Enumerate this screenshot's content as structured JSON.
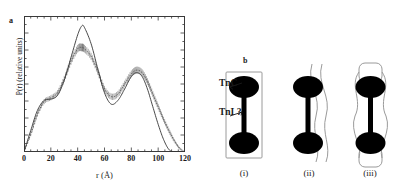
{
  "figure": {
    "panel_a_label": "a",
    "panel_b_label": "b"
  },
  "panel_a": {
    "xlabel": "r (Å)",
    "ylabel": "P(r) (relative units)",
    "xticklabels": [
      "0",
      "20",
      "40",
      "60",
      "80",
      "100",
      "120"
    ]
  },
  "panel_b": {
    "annotations": {
      "tnc": "TnC",
      "tni": "TnI ?"
    },
    "model_labels": [
      "(i)",
      "(ii)",
      "(iii)"
    ],
    "colors": {
      "domain_fill": "#000000",
      "outline": "#8a8a8a",
      "linker": "#000000"
    }
  },
  "chart_data": {
    "type": "line",
    "title": "",
    "xlabel": "r (Å)",
    "ylabel": "P(r) (relative units)",
    "xlim": [
      0,
      120
    ],
    "ylim": [
      0,
      1.08
    ],
    "grid": false,
    "legend": "none",
    "xticks": [
      0,
      20,
      40,
      60,
      80,
      100,
      120
    ],
    "xtick_labels": [
      "0",
      "20",
      "40",
      "60",
      "80",
      "100",
      "120"
    ],
    "yticks_labeled": false,
    "x": [
      0,
      5,
      10,
      15,
      20,
      25,
      30,
      35,
      40,
      43,
      45,
      50,
      55,
      60,
      65,
      70,
      75,
      80,
      84,
      88,
      92,
      96,
      100,
      104,
      108,
      112,
      116,
      120
    ],
    "series": [
      {
        "name": "solid curve",
        "style": "solid",
        "values": [
          0.0,
          0.17,
          0.33,
          0.41,
          0.42,
          0.45,
          0.57,
          0.75,
          0.93,
          1.0,
          0.99,
          0.86,
          0.66,
          0.47,
          0.38,
          0.41,
          0.5,
          0.6,
          0.63,
          0.6,
          0.5,
          0.36,
          0.22,
          0.1,
          0.02,
          0.0,
          0.0,
          0.0
        ]
      },
      {
        "name": "dashed curve with error bars",
        "style": "dashed-with-errorbars",
        "values": [
          0.0,
          0.14,
          0.3,
          0.4,
          0.43,
          0.47,
          0.58,
          0.72,
          0.82,
          0.83,
          0.82,
          0.76,
          0.64,
          0.5,
          0.44,
          0.46,
          0.54,
          0.62,
          0.65,
          0.63,
          0.56,
          0.46,
          0.36,
          0.26,
          0.17,
          0.09,
          0.03,
          0.0
        ],
        "errors": [
          0.0,
          0.015,
          0.02,
          0.02,
          0.02,
          0.022,
          0.025,
          0.028,
          0.03,
          0.03,
          0.03,
          0.028,
          0.027,
          0.025,
          0.025,
          0.025,
          0.026,
          0.027,
          0.028,
          0.027,
          0.026,
          0.024,
          0.022,
          0.02,
          0.018,
          0.014,
          0.01,
          0.0
        ]
      }
    ]
  }
}
